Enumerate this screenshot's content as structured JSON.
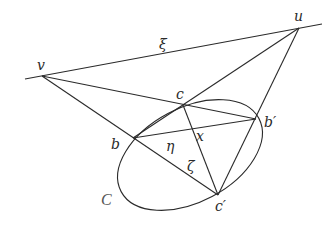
{
  "diagram": {
    "title": "",
    "points": {
      "v": {
        "label": "v",
        "x": 42,
        "y": 76
      },
      "u": {
        "label": "u",
        "x": 299,
        "y": 28
      },
      "c": {
        "label": "c",
        "x": 183,
        "y": 105
      },
      "b_prime": {
        "label": "b′",
        "x": 256,
        "y": 119
      },
      "b": {
        "label": "b",
        "x": 133,
        "y": 138
      },
      "c_prime": {
        "label": "c′",
        "x": 218,
        "y": 195
      },
      "x": {
        "label": "x",
        "x": 193,
        "y": 131
      }
    },
    "line_labels": {
      "xi": "ξ",
      "eta": "η",
      "zeta": "ζ"
    },
    "conic_label": "C",
    "conic": {
      "cx": 190,
      "cy": 155,
      "rx": 78,
      "ry": 47,
      "rotate": -28
    },
    "colors": {
      "stroke": "#2a2a2a",
      "conic_label": "#555555",
      "background": "#ffffff"
    }
  }
}
